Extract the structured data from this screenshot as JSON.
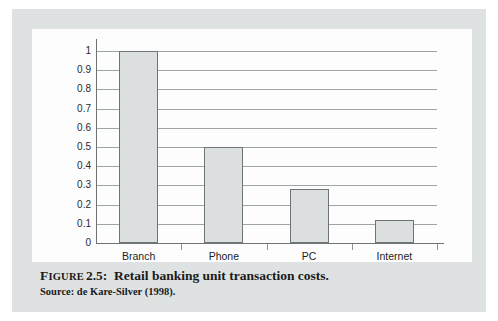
{
  "figure": {
    "label_prefix": "Figure",
    "number": "2.5:",
    "title": "Retail banking unit transaction costs.",
    "source": "Source: de Kare-Silver (1998)."
  },
  "colors": {
    "page_background": "#dfe2e3",
    "panel_background": "#fdfdfd",
    "bar_fill": "#dcdfe0",
    "bar_stroke": "#6f7476",
    "gridline": "#9fa4a6",
    "axis": "#6e7375",
    "text": "#1d1e1f"
  },
  "chart_data": {
    "type": "bar",
    "title": "Retail banking unit transaction costs.",
    "xlabel": "",
    "ylabel": "",
    "categories": [
      "Branch",
      "Phone",
      "PC",
      "Internet"
    ],
    "values": [
      1,
      0.5,
      0.28,
      0.12
    ],
    "ylim": [
      0,
      1
    ],
    "yticks": [
      0,
      0.1,
      0.2,
      0.3,
      0.4,
      0.5,
      0.6,
      0.7,
      0.8,
      0.9,
      1
    ],
    "ytick_labels": [
      "0",
      "0.1",
      "0.2",
      "0.3",
      "0.4",
      "0.5",
      "0.6",
      "0.7",
      "0.8",
      "0.9",
      "1"
    ],
    "grid": true,
    "legend": false,
    "legend_position": "none"
  }
}
